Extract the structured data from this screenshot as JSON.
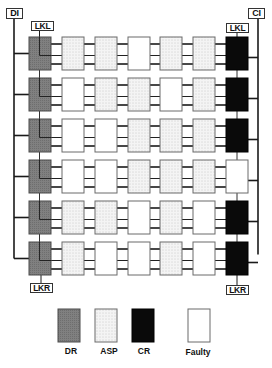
{
  "labels": {
    "di": "DI",
    "ci": "CI",
    "lkl_left": "LKL",
    "lkl_right": "LKL",
    "lkr_left": "LKR",
    "lkr_right": "LKR"
  },
  "legend": [
    {
      "type": "DR",
      "label": "DR"
    },
    {
      "type": "ASP",
      "label": "ASP"
    },
    {
      "type": "CR",
      "label": "CR"
    },
    {
      "type": "Faulty",
      "label": "Faulty"
    }
  ],
  "colors": {
    "DR": "#7f7f7f",
    "ASP": "#f1f1f1",
    "CR": "#0a0a0a",
    "Faulty": "#ffffff",
    "line": "#1a1a1a",
    "border": "#555555"
  },
  "grid": {
    "columns": [
      "DR",
      "ASP",
      "ASP",
      "ASP",
      "ASP",
      "ASP",
      "CR"
    ],
    "rows": [
      [
        "DR",
        "ASP",
        "ASP",
        "Faulty",
        "ASP",
        "ASP",
        "CR"
      ],
      [
        "DR",
        "Faulty",
        "ASP",
        "ASP",
        "Faulty",
        "ASP",
        "CR"
      ],
      [
        "DR",
        "Faulty",
        "Faulty",
        "ASP",
        "ASP",
        "ASP",
        "CR"
      ],
      [
        "DR",
        "Faulty",
        "Faulty",
        "ASP",
        "ASP",
        "ASP",
        "Faulty"
      ],
      [
        "DR",
        "ASP",
        "ASP",
        "Faulty",
        "ASP",
        "Faulty",
        "CR"
      ],
      [
        "DR",
        "ASP",
        "Faulty",
        "Faulty",
        "ASP",
        "Faulty",
        "CR"
      ]
    ]
  }
}
